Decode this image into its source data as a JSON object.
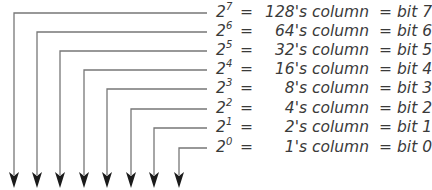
{
  "diagram": {
    "line_color": "#777777",
    "arrow_color": "#1a1a1a",
    "rows": [
      {
        "base": "2",
        "exp": "7",
        "eq": "=",
        "column": "128's column",
        "eq2": "=",
        "bit": "bit 7"
      },
      {
        "base": "2",
        "exp": "6",
        "eq": "=",
        "column": "64's column",
        "eq2": "=",
        "bit": "bit 6"
      },
      {
        "base": "2",
        "exp": "5",
        "eq": "=",
        "column": "32's column",
        "eq2": "=",
        "bit": "bit 5"
      },
      {
        "base": "2",
        "exp": "4",
        "eq": "=",
        "column": "16's column",
        "eq2": "=",
        "bit": "bit 4"
      },
      {
        "base": "2",
        "exp": "3",
        "eq": "=",
        "column": "8's column",
        "eq2": "=",
        "bit": "bit 3"
      },
      {
        "base": "2",
        "exp": "2",
        "eq": "=",
        "column": "4's column",
        "eq2": "=",
        "bit": "bit 2"
      },
      {
        "base": "2",
        "exp": "1",
        "eq": "=",
        "column": "2's column",
        "eq2": "=",
        "bit": "bit 1"
      },
      {
        "base": "2",
        "exp": "0",
        "eq": "=",
        "column": "1's column",
        "eq2": "=",
        "bit": "bit 0"
      }
    ]
  }
}
